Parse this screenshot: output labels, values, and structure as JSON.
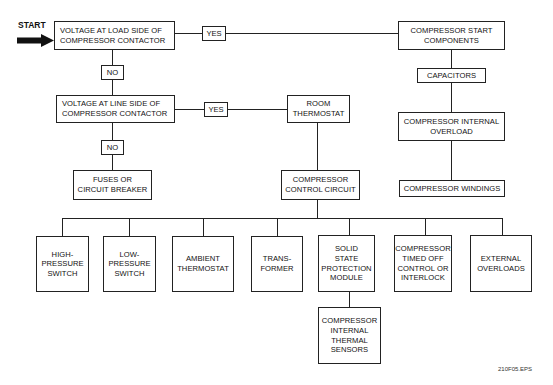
{
  "start_label": "START",
  "footer_label": "210F05.EPS",
  "connectors": {
    "yes_1": "YES",
    "yes_2": "YES",
    "no_1": "NO",
    "no_2": "NO"
  },
  "nodes": {
    "voltage_load": "VOLTAGE AT LOAD SIDE OF\nCOMPRESSOR CONTACTOR",
    "voltage_line": "VOLTAGE AT LINE SIDE OF\nCOMPRESSOR CONTACTOR",
    "fuses": "FUSES OR\nCIRCUIT BREAKER",
    "start_components": "COMPRESSOR START\nCOMPONENTS",
    "capacitors": "CAPACITORS",
    "internal_overload": "COMPRESSOR INTERNAL\nOVERLOAD",
    "windings": "COMPRESSOR WINDINGS",
    "room_thermostat": "ROOM\nTHERMOSTAT",
    "control_circuit": "COMPRESSOR\nCONTROL CIRCUIT",
    "high_pressure": "HIGH-\nPRESSURE\nSWITCH",
    "low_pressure": "LOW-\nPRESSURE\nSWITCH",
    "ambient": "AMBIENT\nTHERMOSTAT",
    "transformer": "TRANS-\nFORMER",
    "solid_state": "SOLID\nSTATE\nPROTECTION\nMODULE",
    "timed_off": "COMPRESSOR\nTIMED OFF\nCONTROL OR\nINTERLOCK",
    "external_overloads": "EXTERNAL\nOVERLOADS",
    "thermal_sensors": "COMPRESSOR\nINTERNAL\nTHERMAL\nSENSORS"
  }
}
